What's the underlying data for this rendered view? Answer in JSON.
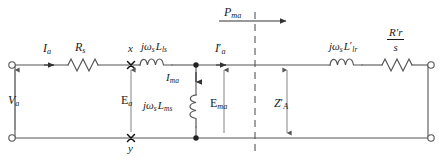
{
  "diagram": {
    "type": "electrical-schematic",
    "stroke_color": "#555555",
    "text_color": "#1a1a1a",
    "background": "#ffffff"
  },
  "labels": {
    "stator_current": {
      "symbol": "I",
      "sub": "a"
    },
    "stator_resistance": {
      "symbol": "R",
      "sub": "s"
    },
    "node_x": {
      "symbol": "x"
    },
    "node_y": {
      "symbol": "y"
    },
    "stator_leakage": {
      "j": "j",
      "omega": "ω",
      "omega_sub": "s",
      "L": "L",
      "L_sub": "ls"
    },
    "air_gap_power": {
      "symbol": "P",
      "sub": "ma"
    },
    "rotor_current": {
      "symbol": "I",
      "prime": "′",
      "sub": "a"
    },
    "rotor_leakage": {
      "j": "j",
      "omega": "ω",
      "omega_sub": "s",
      "L": "L",
      "prime": "′",
      "L_sub": "lr"
    },
    "rotor_resistance_over_slip": {
      "num_symbol": "R",
      "num_prime": "′",
      "num_sub": "r",
      "den": "s"
    },
    "terminal_voltage": {
      "symbol": "V",
      "sub": "a"
    },
    "air_gap_emf": {
      "symbol": "E",
      "sub": "a"
    },
    "magnetizing_current": {
      "symbol": "I",
      "sub": "ma"
    },
    "magnetizing_reactance": {
      "j": "j",
      "omega": "ω",
      "omega_sub": "s",
      "L": "L",
      "L_sub": "ms"
    },
    "magnetizing_emf": {
      "symbol": "E",
      "sub": "ma"
    },
    "rotor_impedance": {
      "symbol": "Z",
      "prime": "′",
      "sub": "A"
    }
  },
  "components": [
    {
      "name": "stator-resistor",
      "kind": "resistor"
    },
    {
      "name": "stator-leakage-inductor",
      "kind": "inductor"
    },
    {
      "name": "magnetizing-inductor",
      "kind": "inductor"
    },
    {
      "name": "rotor-leakage-inductor",
      "kind": "inductor"
    },
    {
      "name": "rotor-resistor",
      "kind": "resistor"
    }
  ],
  "terminals": [
    {
      "name": "terminal-top-left",
      "style": "open-circle"
    },
    {
      "name": "terminal-bottom-left",
      "style": "open-circle"
    },
    {
      "name": "terminal-top-right",
      "style": "open-circle"
    },
    {
      "name": "terminal-bottom-right",
      "style": "open-circle"
    }
  ],
  "markers": [
    {
      "name": "cross-node-x",
      "style": "cross"
    },
    {
      "name": "cross-node-y",
      "style": "cross"
    },
    {
      "name": "junction-dot-top",
      "style": "filled-dot"
    },
    {
      "name": "junction-dot-bottom",
      "style": "filled-dot"
    }
  ],
  "dashed_line": {
    "name": "air-gap-boundary",
    "style": "dashed-vertical"
  }
}
